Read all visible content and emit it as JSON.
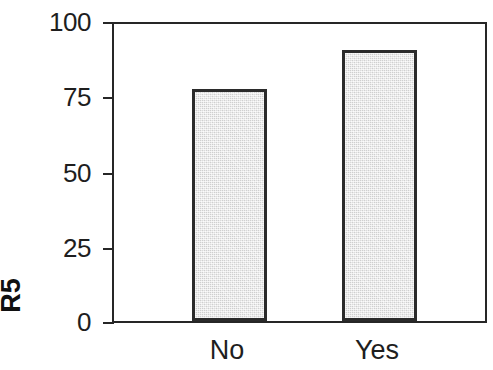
{
  "chart_data": {
    "type": "bar",
    "title": "",
    "subtitle": "",
    "xlabel": "",
    "ylabel": "R5",
    "categories": [
      "No",
      "Yes"
    ],
    "values": [
      77,
      90
    ],
    "series": [
      {
        "name": "R5",
        "values": [
          77,
          90
        ]
      }
    ],
    "ylim": [
      0,
      100
    ],
    "yticks": [
      0,
      25,
      50,
      75,
      100
    ],
    "ytick_labels": [
      "0",
      "25",
      "50",
      "75",
      "100"
    ],
    "grid": false,
    "legend": false,
    "legend_position": "none",
    "annotations": [],
    "colors": {
      "bar_fill": "#e5e5e5",
      "bar_edge": "#2b2b2b",
      "axis": "#262626",
      "text": "#1e1e1e",
      "background": "#ffffff"
    }
  },
  "axis": {
    "y_title": "R5",
    "ticks": [
      {
        "label": "100",
        "value": 100
      },
      {
        "label": "75",
        "value": 75
      },
      {
        "label": "50",
        "value": 50
      },
      {
        "label": "25",
        "value": 25
      },
      {
        "label": "0",
        "value": 0
      }
    ]
  },
  "bars": [
    {
      "category": "No",
      "value": 77
    },
    {
      "category": "Yes",
      "value": 90
    }
  ]
}
